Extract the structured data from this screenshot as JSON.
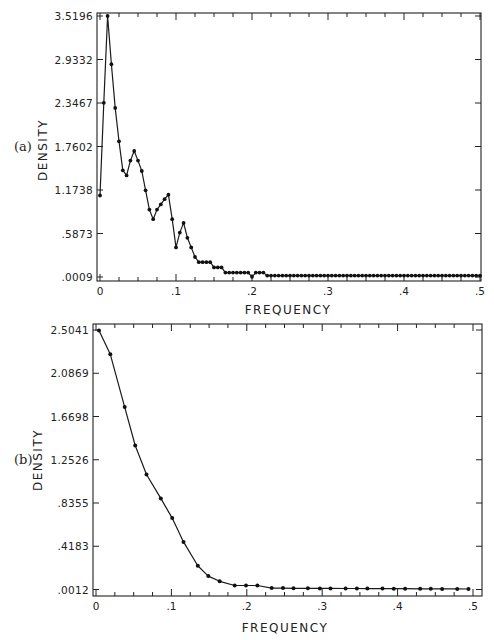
{
  "chart_data": [
    {
      "panel_label": "(a)",
      "type": "line",
      "title": "",
      "xlabel": "FREQUENCY",
      "ylabel": "DENSITY",
      "xlim": [
        0,
        0.5
      ],
      "ylim": [
        0.0009,
        3.5196
      ],
      "x_ticks": [
        "0",
        ".1",
        ".2",
        ".3",
        ".4",
        ".5"
      ],
      "y_ticks": [
        "3.5196",
        "2.9332",
        "2.3467",
        "1.7602",
        "1.1738",
        ".5873",
        ".0009"
      ],
      "grid": false,
      "markers": true,
      "x": [
        0,
        0.005,
        0.01,
        0.015,
        0.02,
        0.025,
        0.03,
        0.035,
        0.04,
        0.045,
        0.05,
        0.055,
        0.06,
        0.065,
        0.07,
        0.075,
        0.08,
        0.085,
        0.09,
        0.095,
        0.1,
        0.105,
        0.11,
        0.115,
        0.12,
        0.125,
        0.13,
        0.135,
        0.14,
        0.145,
        0.15,
        0.155,
        0.16,
        0.165,
        0.17,
        0.175,
        0.18,
        0.185,
        0.19,
        0.195,
        0.2,
        0.205,
        0.21,
        0.215,
        0.22,
        0.225,
        0.23,
        0.235,
        0.24,
        0.245,
        0.25,
        0.255,
        0.26,
        0.265,
        0.27,
        0.275,
        0.28,
        0.285,
        0.29,
        0.295,
        0.3,
        0.305,
        0.31,
        0.315,
        0.32,
        0.325,
        0.33,
        0.335,
        0.34,
        0.345,
        0.35,
        0.355,
        0.36,
        0.365,
        0.37,
        0.375,
        0.38,
        0.385,
        0.39,
        0.395,
        0.4,
        0.405,
        0.41,
        0.415,
        0.42,
        0.425,
        0.43,
        0.435,
        0.44,
        0.445,
        0.45,
        0.455,
        0.46,
        0.465,
        0.47,
        0.475,
        0.48,
        0.485,
        0.49,
        0.495,
        0.5
      ],
      "values": [
        1.1,
        2.35,
        3.52,
        2.87,
        2.28,
        1.83,
        1.44,
        1.37,
        1.57,
        1.7,
        1.57,
        1.43,
        1.17,
        0.91,
        0.78,
        0.91,
        0.98,
        1.05,
        1.11,
        0.78,
        0.4,
        0.6,
        0.73,
        0.53,
        0.4,
        0.27,
        0.2,
        0.2,
        0.2,
        0.2,
        0.13,
        0.13,
        0.13,
        0.06,
        0.06,
        0.06,
        0.06,
        0.06,
        0.06,
        0.06,
        0.004,
        0.06,
        0.06,
        0.06,
        0.02,
        0.02,
        0.02,
        0.02,
        0.02,
        0.02,
        0.02,
        0.02,
        0.02,
        0.02,
        0.02,
        0.02,
        0.02,
        0.02,
        0.02,
        0.02,
        0.02,
        0.02,
        0.02,
        0.02,
        0.02,
        0.02,
        0.02,
        0.02,
        0.02,
        0.02,
        0.02,
        0.02,
        0.02,
        0.02,
        0.02,
        0.02,
        0.02,
        0.02,
        0.02,
        0.02,
        0.02,
        0.02,
        0.02,
        0.02,
        0.02,
        0.02,
        0.02,
        0.02,
        0.02,
        0.02,
        0.02,
        0.02,
        0.02,
        0.02,
        0.02,
        0.02,
        0.02,
        0.02,
        0.02,
        0.02,
        0.02
      ]
    },
    {
      "panel_label": "(b)",
      "type": "line",
      "title": "",
      "xlabel": "FREQUENCY",
      "ylabel": "DENSITY",
      "xlim": [
        0,
        0.5
      ],
      "ylim": [
        0.0012,
        2.5041
      ],
      "x_ticks": [
        "0",
        ".1",
        ".2",
        ".3",
        ".4",
        ".5"
      ],
      "y_ticks": [
        "2.5041",
        "2.0869",
        "1.6698",
        "1.2526",
        ".8355",
        ".4183",
        ".0012"
      ],
      "grid": false,
      "markers": true,
      "x": [
        0.004,
        0.019,
        0.038,
        0.052,
        0.067,
        0.086,
        0.101,
        0.116,
        0.135,
        0.149,
        0.164,
        0.184,
        0.199,
        0.214,
        0.233,
        0.248,
        0.262,
        0.281,
        0.297,
        0.311,
        0.331,
        0.346,
        0.36,
        0.38,
        0.395,
        0.41,
        0.43,
        0.444,
        0.459,
        0.479,
        0.494
      ],
      "values": [
        2.5,
        2.27,
        1.76,
        1.39,
        1.11,
        0.88,
        0.69,
        0.46,
        0.23,
        0.13,
        0.08,
        0.04,
        0.04,
        0.04,
        0.015,
        0.015,
        0.013,
        0.013,
        0.012,
        0.012,
        0.011,
        0.011,
        0.01,
        0.01,
        0.009,
        0.009,
        0.008,
        0.008,
        0.007,
        0.007,
        0.006
      ]
    }
  ]
}
